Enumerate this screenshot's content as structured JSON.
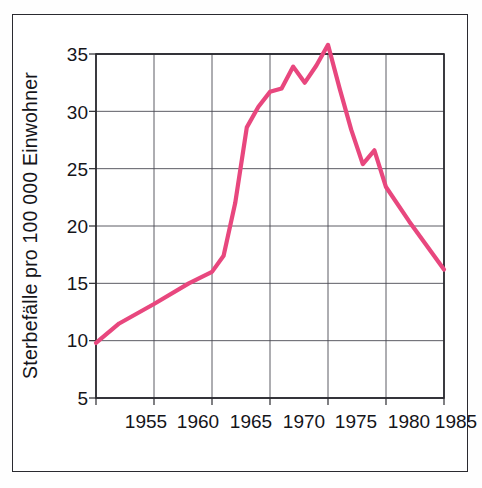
{
  "figure": {
    "border_color": "#2a2a30",
    "background": "#ffffff"
  },
  "chart_data": {
    "type": "line",
    "title": "",
    "xlabel": "",
    "ylabel": "Sterbefälle pro 100 000 Einwohner",
    "xlim": [
      1955,
      1985
    ],
    "ylim": [
      5,
      35
    ],
    "grid": true,
    "legend": null,
    "line_color": "#E8477E",
    "x_ticks": [
      "1955",
      "1960",
      "1965",
      "1970",
      "1975",
      "1980",
      "1985"
    ],
    "y_ticks": [
      "5",
      "10",
      "15",
      "20",
      "25",
      "30",
      "35"
    ],
    "series": [
      {
        "name": "Sterbefälle pro 100 000 Einwohner",
        "color": "#E8477E",
        "x": [
          1955,
          1957,
          1960,
          1963,
          1965,
          1966,
          1967,
          1968,
          1969,
          1970,
          1971,
          1972,
          1973,
          1974,
          1975,
          1976,
          1977,
          1978,
          1979,
          1980,
          1982,
          1985
        ],
        "values": [
          9.8,
          11.5,
          13.2,
          15.0,
          16.0,
          17.4,
          22.0,
          28.6,
          30.4,
          31.7,
          32.0,
          33.9,
          32.5,
          34.0,
          35.8,
          32.0,
          28.4,
          25.4,
          26.6,
          23.4,
          20.4,
          16.2
        ]
      }
    ]
  },
  "axis_labels": {
    "y_axis_title": "Sterbefälle pro 100 000 Einwohner"
  }
}
